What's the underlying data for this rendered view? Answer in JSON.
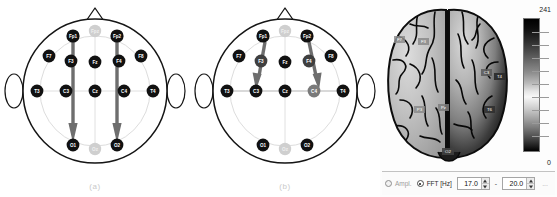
{
  "figure": {
    "panels": [
      {
        "id": "a",
        "caption": "(a)",
        "description": "EEG 10-20 montage, anterior-to-posterior propagation",
        "electrodes": [
          {
            "name": "Fp1",
            "x": 73,
            "y": 36,
            "state": "active"
          },
          {
            "name": "Fpz",
            "x": 95,
            "y": 31,
            "state": "dim"
          },
          {
            "name": "Fp2",
            "x": 117,
            "y": 36,
            "state": "active"
          },
          {
            "name": "F7",
            "x": 49,
            "y": 56,
            "state": "active"
          },
          {
            "name": "F3",
            "x": 71,
            "y": 61,
            "state": "active"
          },
          {
            "name": "Fz",
            "x": 95,
            "y": 62,
            "state": "active"
          },
          {
            "name": "F4",
            "x": 119,
            "y": 61,
            "state": "active"
          },
          {
            "name": "F8",
            "x": 141,
            "y": 56,
            "state": "active"
          },
          {
            "name": "T3",
            "x": 37,
            "y": 91,
            "state": "active"
          },
          {
            "name": "C3",
            "x": 66,
            "y": 91,
            "state": "active"
          },
          {
            "name": "Cz",
            "x": 95,
            "y": 91,
            "state": "active"
          },
          {
            "name": "C4",
            "x": 124,
            "y": 91,
            "state": "active"
          },
          {
            "name": "T4",
            "x": 153,
            "y": 91,
            "state": "active"
          },
          {
            "name": "O1",
            "x": 73,
            "y": 145,
            "state": "active"
          },
          {
            "name": "Oz",
            "x": 95,
            "y": 149,
            "state": "dim"
          },
          {
            "name": "O2",
            "x": 117,
            "y": 145,
            "state": "active"
          }
        ],
        "arrows": [
          {
            "from": "Fp1",
            "to": "O1"
          },
          {
            "from": "Fp2",
            "to": "O2"
          }
        ]
      },
      {
        "id": "b",
        "caption": "(b)",
        "description": "EEG 10-20 montage, frontopolar-to-central propagation",
        "electrodes": [
          {
            "name": "Fp1",
            "x": 73,
            "y": 36,
            "state": "active"
          },
          {
            "name": "Fpz",
            "x": 95,
            "y": 31,
            "state": "dim"
          },
          {
            "name": "Fp2",
            "x": 117,
            "y": 36,
            "state": "active"
          },
          {
            "name": "F7",
            "x": 49,
            "y": 56,
            "state": "active"
          },
          {
            "name": "F3",
            "x": 71,
            "y": 61,
            "state": "active"
          },
          {
            "name": "Fz",
            "x": 95,
            "y": 62,
            "state": "active"
          },
          {
            "name": "F4",
            "x": 119,
            "y": 61,
            "state": "active"
          },
          {
            "name": "F8",
            "x": 141,
            "y": 56,
            "state": "active"
          },
          {
            "name": "T3",
            "x": 37,
            "y": 91,
            "state": "active"
          },
          {
            "name": "C3",
            "x": 66,
            "y": 91,
            "state": "active"
          },
          {
            "name": "Cz",
            "x": 95,
            "y": 91,
            "state": "active"
          },
          {
            "name": "C4",
            "x": 124,
            "y": 91,
            "state": "active"
          },
          {
            "name": "T4",
            "x": 153,
            "y": 91,
            "state": "active"
          },
          {
            "name": "O1",
            "x": 73,
            "y": 145,
            "state": "active"
          },
          {
            "name": "Oz",
            "x": 95,
            "y": 149,
            "state": "dim"
          },
          {
            "name": "O2",
            "x": 117,
            "y": 145,
            "state": "active"
          }
        ],
        "arrows": [
          {
            "from": "Fp1",
            "to": "C3"
          },
          {
            "from": "Fp2",
            "to": "C4"
          }
        ]
      }
    ]
  },
  "brain_panel": {
    "title": "",
    "labels": [
      {
        "name": "F7",
        "x": 20,
        "y": 40
      },
      {
        "name": "F3",
        "x": 44,
        "y": 42
      },
      {
        "name": "C3",
        "x": 107,
        "y": 73
      },
      {
        "name": "T4",
        "x": 120,
        "y": 77
      },
      {
        "name": "P3",
        "x": 40,
        "y": 110
      },
      {
        "name": "Pz",
        "x": 64,
        "y": 108
      },
      {
        "name": "T6",
        "x": 110,
        "y": 110
      },
      {
        "name": "O2",
        "x": 80,
        "y": 150
      }
    ],
    "colorbar": {
      "max_label": "241",
      "min_label": "0",
      "max_value": 241,
      "min_value": 0,
      "ticks": 10
    },
    "controls": {
      "mode_options": [
        {
          "label": "Ampl.",
          "selected": false
        },
        {
          "label": "FFT [Hz]",
          "selected": true
        }
      ],
      "ampl_label": "Ampl.",
      "fft_label": "FFT [Hz]",
      "freq_low": "17.0",
      "freq_high": "20.0",
      "range_separator": "-",
      "trailing": "..."
    }
  },
  "colors": {
    "arrow": "#6e6e6e",
    "electrode_active": "#111111",
    "electrode_dim": "#cfcfcf",
    "head_outline": "#151515",
    "grid": "#d9d9d9",
    "caption": "#c9c9c9"
  }
}
